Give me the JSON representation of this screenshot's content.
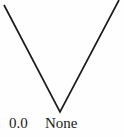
{
  "figure": {
    "width": 124,
    "height": 137,
    "background_color": "#fefefe",
    "stroke_color": "#1c1a1a",
    "stroke_width": 1.7,
    "text_color": "#1a1a1a"
  },
  "labels": {
    "value_label": "0.0",
    "name_label": "None"
  },
  "chart_data": {
    "type": "line",
    "title": "",
    "xlabel": "",
    "ylabel": "",
    "grid": false,
    "legend": null,
    "annotations": [
      "0.0",
      "None"
    ],
    "series": [
      {
        "name": "v-shape",
        "x": [
          4,
          60,
          119
        ],
        "y": [
          5,
          112,
          0
        ]
      }
    ],
    "xlim": [
      0,
      124
    ],
    "ylim": [
      0,
      137
    ],
    "tick_labels": {
      "x": [
        "0.0",
        "None"
      ]
    },
    "values": [
      5,
      112,
      0
    ],
    "categories": [
      "start",
      "vertex",
      "end"
    ]
  }
}
